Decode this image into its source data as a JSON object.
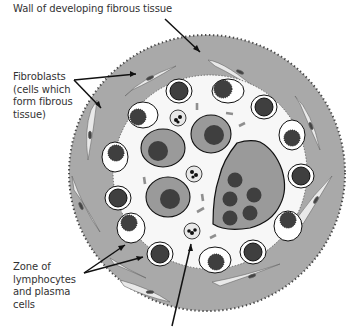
{
  "labels": {
    "wall": "Wall of developing fibrous tissue",
    "fibroblasts": [
      "Fibroblasts",
      "(cells which",
      "form fibrous",
      "tissue)"
    ],
    "zone": [
      "Zone of",
      "lymphocytes",
      "and plasma",
      "cells"
    ]
  },
  "colors": {
    "wall_gray": "#a9a9a9",
    "inner_white": "#f7f7f7",
    "nucleus_dark": "#3f3f3f",
    "cell_gray": "#9a9a9a",
    "outline": "#111111",
    "dash_gray": "#8f8f8f"
  },
  "diagram": {
    "outer_circle": {
      "cx": 207,
      "cy": 173,
      "r": 138
    },
    "inner_zone": {
      "cx": 210,
      "cy": 172,
      "r": 97
    }
  }
}
